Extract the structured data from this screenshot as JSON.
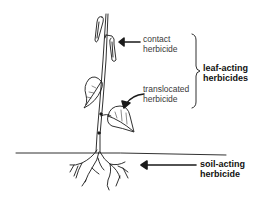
{
  "diagram": {
    "labels": {
      "contact": {
        "line1": "contact",
        "line2": "herbicide"
      },
      "translocated": {
        "line1": "translocated",
        "line2": "herbicide"
      },
      "leaf_acting": {
        "line1": "leaf-acting",
        "line2": "herbicides"
      },
      "soil_acting": {
        "line1": "soil-acting",
        "line2": "herbicide"
      }
    },
    "colors": {
      "ink": "#1a1a1a",
      "text": "#3a3a3a",
      "background": "#ffffff"
    }
  }
}
